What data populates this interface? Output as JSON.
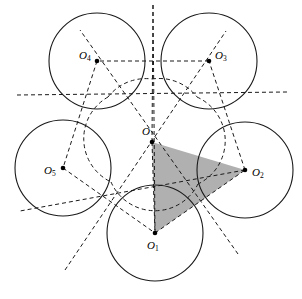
{
  "figure": {
    "width": 302,
    "height": 299,
    "background_color": "#ffffff",
    "stroke_color": "#1a1a1a",
    "shaded_fill_color": "#b0b0b0",
    "circle_radius": 48,
    "circle_stroke_width": 1.1,
    "dash_pattern": "4,3"
  },
  "points": [
    {
      "id": "O",
      "label": "O",
      "sub": "",
      "x": 152,
      "y": 142,
      "label_x": 142,
      "label_y": 126,
      "dot": true
    },
    {
      "id": "O1",
      "label": "O",
      "sub": "1",
      "x": 155,
      "y": 233,
      "label_x": 147,
      "label_y": 240,
      "dot": true
    },
    {
      "id": "O2",
      "label": "O",
      "sub": "2",
      "x": 245,
      "y": 170,
      "label_x": 252,
      "label_y": 167,
      "dot": true
    },
    {
      "id": "O3",
      "label": "O",
      "sub": "3",
      "x": 209,
      "y": 61,
      "label_x": 215,
      "label_y": 50,
      "dot": true
    },
    {
      "id": "O4",
      "label": "O",
      "sub": "4",
      "x": 97,
      "y": 61,
      "label_x": 79,
      "label_y": 50,
      "dot": true
    },
    {
      "id": "O5",
      "label": "O",
      "sub": "5",
      "x": 63,
      "y": 168,
      "label_x": 44,
      "label_y": 165,
      "dot": true
    }
  ],
  "circles": [
    {
      "id": "circle-O1",
      "center": "O1",
      "cx": 155,
      "cy": 233,
      "r": 48
    },
    {
      "id": "circle-O2",
      "center": "O2",
      "cx": 245,
      "cy": 170,
      "r": 48
    },
    {
      "id": "circle-O3",
      "center": "O3",
      "cx": 209,
      "cy": 61,
      "r": 48
    },
    {
      "id": "circle-O4",
      "center": "O4",
      "cx": 97,
      "cy": 61,
      "r": 48
    },
    {
      "id": "circle-O5",
      "center": "O5",
      "cx": 63,
      "cy": 168,
      "r": 48
    }
  ],
  "pentagon_edges": [
    {
      "id": "edge-O1-O2",
      "from": "O1",
      "to": "O2",
      "x1": 155,
      "y1": 233,
      "x2": 245,
      "y2": 170
    },
    {
      "id": "edge-O2-O3",
      "from": "O2",
      "to": "O3",
      "x1": 245,
      "y1": 170,
      "x2": 209,
      "y2": 61
    },
    {
      "id": "edge-O3-O4",
      "from": "O3",
      "to": "O4",
      "x1": 209,
      "y1": 61,
      "x2": 97,
      "y2": 61
    },
    {
      "id": "edge-O4-O5",
      "from": "O4",
      "to": "O5",
      "x1": 97,
      "y1": 61,
      "x2": 63,
      "y2": 168
    },
    {
      "id": "edge-O5-O1",
      "from": "O5",
      "to": "O1",
      "x1": 63,
      "y1": 168,
      "x2": 155,
      "y2": 233
    }
  ],
  "radial_rays": [
    {
      "id": "ray-O-O1",
      "through": "O1",
      "x1": 153,
      "y1": 5,
      "x2": 155,
      "y2": 233
    },
    {
      "id": "ray-O-O2",
      "through": "O2",
      "x1": 17,
      "y1": 95,
      "x2": 287,
      "y2": 92
    },
    {
      "id": "ray-O-O3",
      "through": "O3",
      "x1": 65,
      "y1": 270,
      "x2": 226,
      "y2": 31
    },
    {
      "id": "ray-O-O4",
      "through": "O4",
      "x1": 238,
      "y1": 254,
      "x2": 80,
      "y2": 30
    },
    {
      "id": "ray-O-O5",
      "through": "O5",
      "x1": 245,
      "y1": 170,
      "x2": 20,
      "y2": 211
    }
  ],
  "shaded_triangle": {
    "id": "triangle-O-O2-O1",
    "vertices": [
      "O",
      "O2",
      "O1"
    ],
    "points": "152,142 245,170 155,233",
    "fill": "#b0b0b0"
  }
}
